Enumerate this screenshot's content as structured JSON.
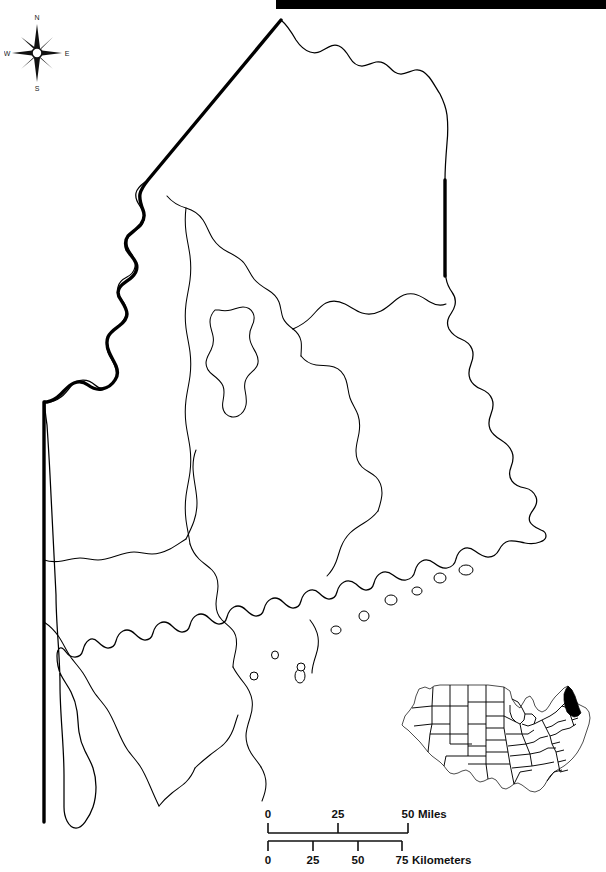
{
  "map": {
    "title": "Maine",
    "subject_state": "Maine",
    "type": "outline-map-with-county-boundaries",
    "background_color": "#ffffff",
    "line_color": "#000000"
  },
  "top_bar": {
    "color": "#000000"
  },
  "compass": {
    "north_label": "N",
    "south_label": "S",
    "east_label": "E",
    "west_label": "W"
  },
  "scale": {
    "miles": {
      "unit_label": "Miles",
      "ticks": [
        "0",
        "25",
        "50"
      ],
      "max": 50
    },
    "kilometers": {
      "unit_label": "Kilometers",
      "ticks": [
        "0",
        "25",
        "50",
        "75"
      ],
      "max": 75
    }
  },
  "inset": {
    "region": "Contiguous United States",
    "highlighted_state": "Maine",
    "highlight_color": "#000000"
  }
}
